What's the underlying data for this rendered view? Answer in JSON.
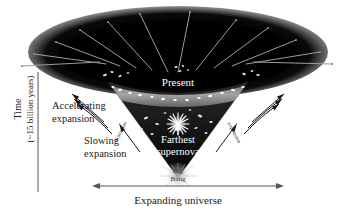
{
  "figure": {
    "type": "cosmology-expansion-diagram",
    "background_color": "#ffffff"
  },
  "axis": {
    "time": {
      "line1": "Time",
      "line2": "(~15 billion years)"
    },
    "horizontal": {
      "label": "Expanding universe",
      "arrow": "double-headed"
    }
  },
  "annotations": {
    "accelerating": {
      "line1": "Accelerating",
      "line2": "expansion"
    },
    "slowing": {
      "line1": "Slowing",
      "line2": "expansion"
    },
    "present": "Present",
    "farthest_supernova": {
      "line1": "Farthest",
      "line2": "supernova"
    },
    "big_bang": {
      "line1": "Big",
      "line2": "Bang"
    },
    "edge_left": "expansion",
    "edge_right": "expansion"
  },
  "colors": {
    "cone_dark": "#050505",
    "cone_mid": "#1d1d1d",
    "present_band": "#b9b9b9",
    "ray": "#9a9a9a",
    "text_dark": "#1a1a1a",
    "text_light": "#ffffff"
  }
}
